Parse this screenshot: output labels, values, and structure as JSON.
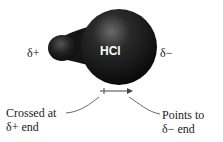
{
  "molecule": {
    "label": "HCl"
  },
  "labels": {
    "delta_plus": "δ+",
    "delta_minus": "δ−",
    "crossed_line1": "Crossed at",
    "crossed_line2": "δ+ end",
    "points_line1": "Points to",
    "points_line2": "δ− end"
  },
  "colors": {
    "molecule": "#111111",
    "highlight": "#6a6a6a",
    "line": "#333333"
  }
}
